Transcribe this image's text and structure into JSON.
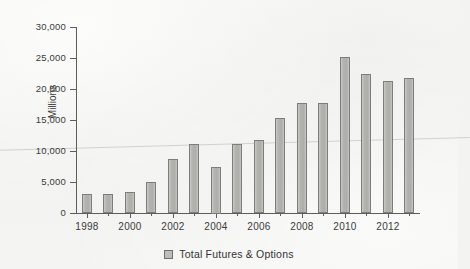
{
  "chart_data": {
    "type": "bar",
    "title": "",
    "xlabel": "",
    "ylabel": "Millions",
    "ylim": [
      0,
      30000
    ],
    "yticks": [
      "0",
      "5,000",
      "10,000",
      "15,000",
      "20,000",
      "25,000",
      "30,000"
    ],
    "ytick_values": [
      0,
      5000,
      10000,
      15000,
      20000,
      25000,
      30000
    ],
    "grid": false,
    "legend_position": "bottom",
    "categories": [
      "1998",
      "1999",
      "2000",
      "2001",
      "2002",
      "2003",
      "2004",
      "2005",
      "2006",
      "2007",
      "2008",
      "2009",
      "2010",
      "2011",
      "2012",
      "2013"
    ],
    "xtick_labels_shown": [
      "1998",
      "2000",
      "2002",
      "2004",
      "2006",
      "2008",
      "2010",
      "2012"
    ],
    "series": [
      {
        "name": "Total Futures & Options",
        "values": [
          3000,
          3050,
          3450,
          5000,
          8700,
          11100,
          7500,
          11200,
          11800,
          15300,
          17800,
          17800,
          25200,
          22400,
          21300,
          21700
        ]
      }
    ]
  },
  "legend": {
    "entries": [
      {
        "label": "Total Futures & Options",
        "swatch_color": "#bdbdba"
      }
    ]
  },
  "axes": {
    "y_title": "Millions"
  },
  "colors": {
    "bar_fill": "#b3b3af",
    "bar_border": "#7d7d79",
    "axis": "#5d5d5d",
    "text": "#3b3b3b",
    "background": "#f3f3f1"
  }
}
